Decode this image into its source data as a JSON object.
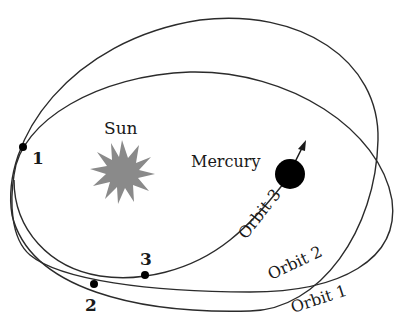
{
  "diagram": {
    "labels": {
      "sun": "Sun",
      "mercury": "Mercury",
      "orbit1": "Orbit 1",
      "orbit2": "Orbit 2",
      "orbit3": "Orbit 3"
    },
    "points": [
      {
        "id": "1",
        "label": "1"
      },
      {
        "id": "2",
        "label": "2"
      },
      {
        "id": "3",
        "label": "3"
      }
    ],
    "colors": {
      "sun": "#8a8a8a",
      "mercury": "#000000",
      "orbit_stroke": "#2b2b2b",
      "background": "#ffffff"
    }
  }
}
